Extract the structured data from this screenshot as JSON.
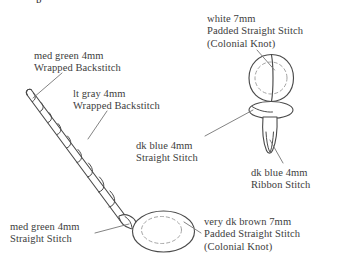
{
  "figure": {
    "background_color": "#ffffff",
    "ink_color": "#3d3d3d",
    "line_color": "#4a4a4a",
    "dashed_color": "#9a9a9a",
    "partial_top_text": "p"
  },
  "labels": [
    {
      "id": "white",
      "lines": [
        "white  7mm",
        "Padded Straight Stitch",
        "(Colonial Knot)"
      ],
      "color_name": "white",
      "ribbon_width": "7mm",
      "stitch": "Padded Straight Stitch (Colonial Knot)",
      "points_to": "round-bud"
    },
    {
      "id": "medgreen-wrapped",
      "lines": [
        "med green 4mm",
        "Wrapped Backstitch"
      ],
      "color_name": "med green",
      "ribbon_width": "4mm",
      "stitch": "Wrapped Backstitch",
      "points_to": "stem-tip"
    },
    {
      "id": "ltgray-wrapped",
      "lines": [
        "lt gray  4mm",
        "Wrapped Backstitch"
      ],
      "color_name": "lt gray",
      "ribbon_width": "4mm",
      "stitch": "Wrapped Backstitch",
      "points_to": "stem-middle"
    },
    {
      "id": "dkblue-straight",
      "lines": [
        "dk blue  4mm",
        "Straight Stitch"
      ],
      "color_name": "dk blue",
      "ribbon_width": "4mm",
      "stitch": "Straight Stitch",
      "points_to": "bud-collar"
    },
    {
      "id": "dkblue-ribbon",
      "lines": [
        "dk blue  4mm",
        "Ribbon Stitch"
      ],
      "color_name": "dk blue",
      "ribbon_width": "4mm",
      "stitch": "Ribbon Stitch",
      "points_to": "ribbon-petal"
    },
    {
      "id": "medgreen-straight",
      "lines": [
        "med green  4mm",
        "Straight Stitch"
      ],
      "color_name": "med green",
      "ribbon_width": "4mm",
      "stitch": "Straight Stitch",
      "points_to": "stem-base-collar"
    },
    {
      "id": "dkbrown",
      "lines": [
        "very dk brown  7mm",
        "Padded Straight Stitch",
        "(Colonial Knot)"
      ],
      "color_name": "very dk brown",
      "ribbon_width": "7mm",
      "stitch": "Padded Straight Stitch (Colonial Knot)",
      "points_to": "oval-base"
    }
  ]
}
